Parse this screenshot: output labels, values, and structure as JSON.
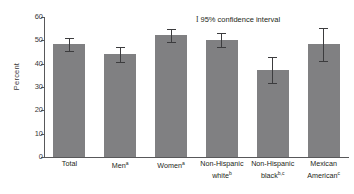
{
  "chart_data": {
    "type": "bar",
    "title": "",
    "subtitle": "",
    "xlabel": "",
    "ylabel": "Percent",
    "ylim": [
      0,
      60
    ],
    "yticks": [
      0,
      10,
      20,
      30,
      40,
      50,
      60
    ],
    "ytick_labels": [
      "0",
      "10",
      "20",
      "30",
      "40",
      "50",
      "60"
    ],
    "grid": false,
    "legend_position": "top-right",
    "legend": [
      {
        "glyph": "I",
        "label": "95% confidence interval"
      }
    ],
    "bar_color": "#808082",
    "error_color": "#3c3c3e",
    "axis_color": "#58585a",
    "categories": [
      "Total",
      "Men",
      "Women",
      "Non-Hispanic white",
      "Non-Hispanic black",
      "Mexican American"
    ],
    "category_superscripts": [
      "",
      "a",
      "a",
      "b",
      "b,c",
      "c"
    ],
    "category_lines": [
      [
        "Total"
      ],
      [
        "Men"
      ],
      [
        "Women"
      ],
      [
        "Non-Hispanic",
        "white"
      ],
      [
        "Non-Hispanic",
        "black"
      ],
      [
        "Mexican",
        "American"
      ]
    ],
    "values": [
      48.3,
      44.0,
      52.5,
      50.0,
      37.3,
      48.3
    ],
    "ci_low": [
      45.5,
      40.8,
      49.3,
      47.0,
      31.8,
      41.3
    ],
    "ci_high": [
      51.0,
      47.3,
      55.0,
      53.0,
      42.8,
      55.3
    ],
    "series": [
      {
        "name": "Percent",
        "values": [
          48.3,
          44.0,
          52.5,
          50.0,
          37.3,
          48.3
        ]
      }
    ]
  }
}
